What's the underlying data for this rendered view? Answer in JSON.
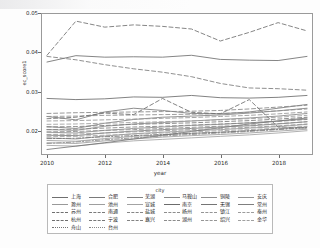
{
  "chart_data": {
    "type": "line",
    "title": "",
    "xlabel": "year",
    "ylabel": "ec_score1",
    "legend_title": "city",
    "legend_position": "bottom",
    "grid": false,
    "xlim": [
      2010,
      2019
    ],
    "ylim": [
      0.0148,
      0.0505
    ],
    "x": [
      2010,
      2011,
      2012,
      2013,
      2014,
      2015,
      2016,
      2017,
      2018,
      2019
    ],
    "xticks": [
      "2010",
      "2012",
      "2014",
      "2016",
      "2018"
    ],
    "xtick_values": [
      2010,
      2012,
      2014,
      2016,
      2018
    ],
    "yticks": [
      "0.02",
      "0.03",
      "0.04",
      "0.05"
    ],
    "ytick_values": [
      0.02,
      0.03,
      0.04,
      0.05
    ],
    "series": [
      {
        "name": "上海",
        "linetype": "solid",
        "color": "#6f6f6f",
        "values": [
          0.0385,
          0.0402,
          0.0398,
          0.0399,
          0.0398,
          0.0403,
          0.0392,
          0.039,
          0.0389,
          0.04
        ]
      },
      {
        "name": "合肥",
        "linetype": "solid",
        "color": "#7a7a7a",
        "values": [
          0.024,
          0.0231,
          0.0252,
          0.0262,
          0.0256,
          0.0248,
          0.0247,
          0.0252,
          0.0262,
          0.0272
        ]
      },
      {
        "name": "芜湖",
        "linetype": "solid",
        "color": "#828282",
        "values": [
          0.0213,
          0.0208,
          0.0222,
          0.0232,
          0.0238,
          0.0241,
          0.0244,
          0.0249,
          0.0255,
          0.0262
        ]
      },
      {
        "name": "马鞍山",
        "linetype": "solid",
        "color": "#888888",
        "values": [
          0.0205,
          0.0203,
          0.0214,
          0.022,
          0.0224,
          0.0228,
          0.0232,
          0.0236,
          0.0241,
          0.0248
        ]
      },
      {
        "name": "铜陵",
        "linetype": "solid",
        "color": "#8e8e8e",
        "values": [
          0.0198,
          0.0196,
          0.0203,
          0.0208,
          0.0212,
          0.0216,
          0.0219,
          0.0223,
          0.0228,
          0.0233
        ]
      },
      {
        "name": "安庆",
        "linetype": "solid",
        "color": "#949494",
        "values": [
          0.0183,
          0.018,
          0.0188,
          0.0194,
          0.0198,
          0.0202,
          0.0205,
          0.0209,
          0.0213,
          0.0219
        ]
      },
      {
        "name": "滁州",
        "linetype": "solid",
        "color": "#999999",
        "values": [
          0.0176,
          0.0174,
          0.0181,
          0.0187,
          0.0191,
          0.0195,
          0.0198,
          0.0202,
          0.0207,
          0.0212
        ]
      },
      {
        "name": "池州",
        "linetype": "solid",
        "color": "#9e9e9e",
        "values": [
          0.017,
          0.0168,
          0.0175,
          0.018,
          0.0185,
          0.0189,
          0.0192,
          0.0196,
          0.0201,
          0.0206
        ]
      },
      {
        "name": "宣城",
        "linetype": "solid",
        "color": "#a3a3a3",
        "values": [
          0.0163,
          0.0161,
          0.0169,
          0.0175,
          0.0179,
          0.0183,
          0.0187,
          0.0191,
          0.0196,
          0.0202
        ]
      },
      {
        "name": "南京",
        "linetype": "solid",
        "color": "#6c6c6c",
        "values": [
          0.0288,
          0.0285,
          0.0287,
          0.0292,
          0.0291,
          0.0296,
          0.029,
          0.0289,
          0.0291,
          0.0296
        ]
      },
      {
        "name": "无锡",
        "linetype": "solid",
        "color": "#757575",
        "values": [
          0.0152,
          0.0161,
          0.017,
          0.018,
          0.019,
          0.02,
          0.021,
          0.022,
          0.0228,
          0.0236
        ]
      },
      {
        "name": "常州",
        "linetype": "solid",
        "color": "#7f7f7f",
        "values": [
          0.019,
          0.0189,
          0.0196,
          0.0201,
          0.0205,
          0.0208,
          0.0212,
          0.0215,
          0.022,
          0.0226
        ]
      },
      {
        "name": "苏州",
        "linetype": "dashed",
        "color": "#707070",
        "values": [
          0.0403,
          0.0494,
          0.0478,
          0.0484,
          0.048,
          0.0473,
          0.0441,
          0.0464,
          0.049,
          0.0468
        ]
      },
      {
        "name": "南通",
        "linetype": "dashed",
        "color": "#7b7b7b",
        "values": [
          0.04,
          0.0391,
          0.0378,
          0.0367,
          0.0358,
          0.0346,
          0.0328,
          0.0316,
          0.0314,
          0.031
        ]
      },
      {
        "name": "盐城",
        "linetype": "dashed",
        "color": "#858585",
        "values": [
          0.0248,
          0.025,
          0.0251,
          0.0252,
          0.0253,
          0.0254,
          0.0256,
          0.026,
          0.0265,
          0.027
        ]
      },
      {
        "name": "扬州",
        "linetype": "dashed",
        "color": "#8d8d8d",
        "values": [
          0.024,
          0.0241,
          0.0243,
          0.0244,
          0.0245,
          0.0246,
          0.0248,
          0.0251,
          0.0255,
          0.026
        ]
      },
      {
        "name": "镇江",
        "linetype": "dashed",
        "color": "#959595",
        "values": [
          0.0228,
          0.0229,
          0.0231,
          0.0233,
          0.0235,
          0.0237,
          0.024,
          0.0243,
          0.0247,
          0.0252
        ]
      },
      {
        "name": "泰州",
        "linetype": "dashed",
        "color": "#9c9c9c",
        "values": [
          0.0219,
          0.022,
          0.0222,
          0.0224,
          0.0226,
          0.0228,
          0.0231,
          0.0234,
          0.0238,
          0.0243
        ]
      },
      {
        "name": "杭州",
        "linetype": "dashed",
        "color": "#6e6e6e",
        "values": [
          0.0234,
          0.0238,
          0.0249,
          0.0245,
          0.0288,
          0.0251,
          0.0247,
          0.0285,
          0.0212,
          0.0209
        ]
      },
      {
        "name": "宁波",
        "linetype": "dashed",
        "color": "#787878",
        "values": [
          0.0212,
          0.0213,
          0.0216,
          0.0219,
          0.0221,
          0.0223,
          0.0226,
          0.0229,
          0.0233,
          0.0238
        ]
      },
      {
        "name": "嘉兴",
        "linetype": "dashed",
        "color": "#838383",
        "values": [
          0.0205,
          0.0206,
          0.0209,
          0.0212,
          0.0214,
          0.0217,
          0.022,
          0.0223,
          0.0227,
          0.0232
        ]
      },
      {
        "name": "湖州",
        "linetype": "dashed",
        "color": "#8c8c8c",
        "values": [
          0.0199,
          0.02,
          0.0203,
          0.0205,
          0.0208,
          0.0211,
          0.0214,
          0.0217,
          0.0221,
          0.0226
        ]
      },
      {
        "name": "绍兴",
        "linetype": "dashed",
        "color": "#969696",
        "values": [
          0.0192,
          0.0193,
          0.0196,
          0.0199,
          0.0202,
          0.0205,
          0.0208,
          0.0211,
          0.0215,
          0.022
        ]
      },
      {
        "name": "金华",
        "linetype": "dashed",
        "color": "#a0a0a0",
        "values": [
          0.0186,
          0.0187,
          0.019,
          0.0193,
          0.0196,
          0.0199,
          0.0202,
          0.0205,
          0.0209,
          0.0214
        ]
      },
      {
        "name": "舟山",
        "linetype": "dashdot",
        "color": "#747474",
        "values": [
          0.0181,
          0.0182,
          0.0186,
          0.0189,
          0.0192,
          0.0195,
          0.0198,
          0.0202,
          0.0206,
          0.0211
        ]
      },
      {
        "name": "台州",
        "linetype": "dashdot",
        "color": "#898989",
        "values": [
          0.0168,
          0.0172,
          0.0178,
          0.0183,
          0.0188,
          0.0192,
          0.0196,
          0.02,
          0.0205,
          0.021
        ]
      }
    ],
    "legend_rows": [
      [
        "上海",
        "合肥",
        "芜湖",
        "马鞍山",
        "铜陵",
        "安庆"
      ],
      [
        "滁州",
        "池州",
        "宣城",
        "南京",
        "无锡",
        "常州"
      ],
      [
        "苏州",
        "南通",
        "盐城",
        "扬州",
        "镇江",
        "泰州"
      ],
      [
        "杭州",
        "宁波",
        "嘉兴",
        "湖州",
        "绍兴",
        "金华"
      ],
      [
        "舟山",
        "台州"
      ]
    ]
  }
}
